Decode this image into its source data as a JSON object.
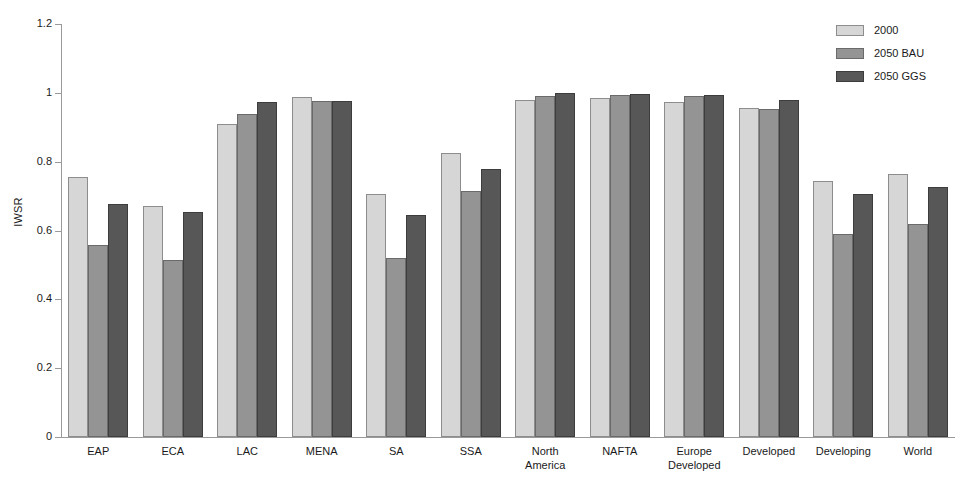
{
  "chart_data": {
    "type": "bar",
    "title": "",
    "xlabel": "",
    "ylabel": "IWSR",
    "ylim": [
      0,
      1.2
    ],
    "yticks": [
      "0",
      "0.2",
      "0.4",
      "0.6",
      "0.8",
      "1",
      "1.2"
    ],
    "ytick_values": [
      0,
      0.2,
      0.4,
      0.6,
      0.8,
      1.0,
      1.2
    ],
    "grid": false,
    "legend_position": "top-right",
    "categories": [
      "EAP",
      "ECA",
      "LAC",
      "MENA",
      "SA",
      "SSA",
      "North\nAmerica",
      "NAFTA",
      "Europe\nDeveloped",
      "Developed",
      "Developing",
      "World"
    ],
    "series": [
      {
        "name": "2000",
        "color": "#d6d6d6",
        "values": [
          0.755,
          0.67,
          0.91,
          0.988,
          0.705,
          0.825,
          0.978,
          0.985,
          0.972,
          0.955,
          0.745,
          0.765
        ]
      },
      {
        "name": "2050 BAU",
        "color": "#949494",
        "values": [
          0.558,
          0.515,
          0.938,
          0.975,
          0.52,
          0.715,
          0.99,
          0.995,
          0.99,
          0.953,
          0.59,
          0.618
        ]
      },
      {
        "name": "2050 GGS",
        "color": "#575757",
        "values": [
          0.678,
          0.655,
          0.972,
          0.975,
          0.645,
          0.78,
          1.0,
          0.998,
          0.995,
          0.98,
          0.705,
          0.725
        ]
      }
    ]
  },
  "legend": {
    "items": [
      {
        "label": "2000"
      },
      {
        "label": "2050 BAU"
      },
      {
        "label": "2050 GGS"
      }
    ]
  }
}
